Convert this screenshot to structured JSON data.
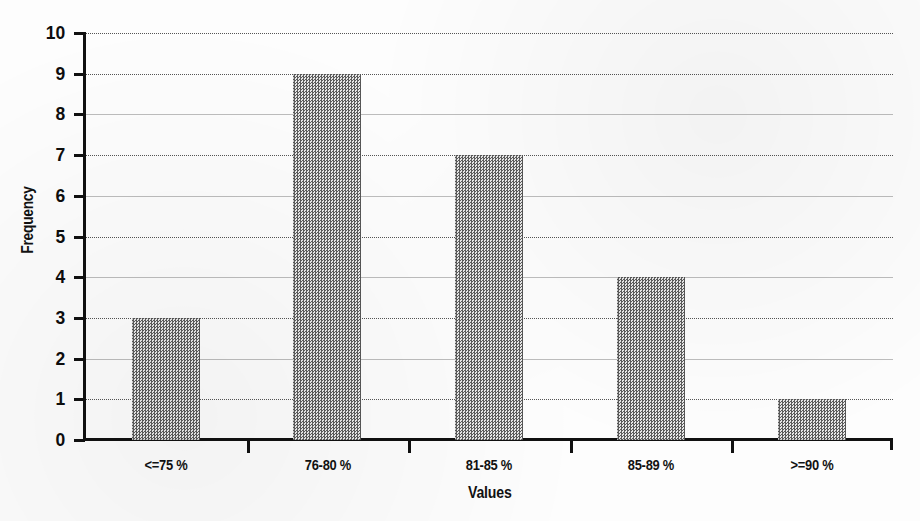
{
  "chart_data": {
    "type": "bar",
    "title": "",
    "xlabel": "Values",
    "ylabel": "Frequency",
    "categories": [
      "<=75 %",
      "76-80 %",
      "81-85 %",
      "85-89 %",
      ">=90 %"
    ],
    "values": [
      3,
      9,
      7,
      4,
      1
    ],
    "ylim": [
      0,
      10
    ],
    "ytick_labels": [
      "0",
      "1",
      "2",
      "3",
      "4",
      "5",
      "6",
      "7",
      "8",
      "9",
      "10"
    ],
    "ytick_values": [
      0,
      1,
      2,
      3,
      4,
      5,
      6,
      7,
      8,
      9,
      10
    ],
    "grid": true,
    "grid_axis": "y",
    "legend": "none",
    "bar_fill": "#6e6e6e",
    "bar_pattern": "50-percent-dither",
    "axis_color": "#111111",
    "background": "#ffffff",
    "series": [
      {
        "name": "Frequency",
        "values": [
          3,
          9,
          7,
          4,
          1
        ]
      }
    ]
  }
}
